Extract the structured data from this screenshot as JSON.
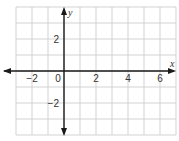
{
  "chart_data": {
    "type": "coordinate-grid",
    "title": "",
    "xlabel": "x",
    "ylabel": "y",
    "xlim": [
      -3,
      7
    ],
    "ylim": [
      -4,
      4
    ],
    "grid": true,
    "grid_step": 1,
    "x_ticks": [
      {
        "value": -2,
        "label": "−2"
      },
      {
        "value": 0,
        "label": "0"
      },
      {
        "value": 2,
        "label": "2"
      },
      {
        "value": 4,
        "label": "4"
      },
      {
        "value": 6,
        "label": "6"
      }
    ],
    "y_ticks": [
      {
        "value": 2,
        "label": "2"
      },
      {
        "value": -2,
        "label": "−2"
      }
    ],
    "axes_arrows": [
      "left",
      "right",
      "up",
      "down"
    ]
  }
}
